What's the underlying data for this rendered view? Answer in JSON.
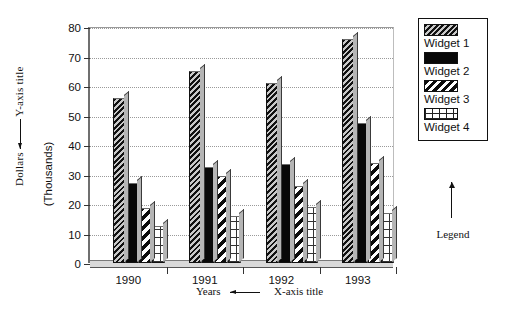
{
  "chart_data": {
    "type": "bar",
    "title": "",
    "categories": [
      "1990",
      "1991",
      "1992",
      "1993"
    ],
    "series": [
      {
        "name": "Widget 1",
        "values": [
          56,
          65,
          61,
          76
        ],
        "pattern": "diagonal-hatch-dark"
      },
      {
        "name": "Widget 2",
        "values": [
          27,
          32.5,
          33.5,
          47.5
        ],
        "pattern": "solid-black"
      },
      {
        "name": "Widget 3",
        "values": [
          18.5,
          29.5,
          26,
          34
        ],
        "pattern": "diagonal-stripe-white-on-black"
      },
      {
        "name": "Widget 4",
        "values": [
          12.5,
          16,
          19,
          17
        ],
        "pattern": "grid-crosshatch"
      }
    ],
    "xlabel": "Years",
    "ylabel": "Dollars",
    "yunits": "(Thousands)",
    "ylim": [
      0,
      80
    ],
    "ytick_step": 10,
    "yticks": [
      "80",
      "70",
      "60",
      "50",
      "40",
      "30",
      "20",
      "10",
      "0"
    ],
    "grid": true,
    "legend_position": "right"
  },
  "annotations": {
    "y_axis_label": "Dollars",
    "y_axis_callout": "Y-axis title",
    "y_axis_units": "(Thousands)",
    "x_axis_label": "Years",
    "x_axis_callout": "X-axis title",
    "legend_callout": "Legend"
  },
  "legend": {
    "entries": [
      {
        "label": "Widget 1"
      },
      {
        "label": "Widget 2"
      },
      {
        "label": "Widget 3"
      },
      {
        "label": "Widget 4"
      }
    ]
  },
  "colors": {
    "axis": "#111111",
    "gridline": "#9a9a9a",
    "bar_black": "#080808",
    "bar_hatch_dark": "#4a4a4a",
    "bar_highlight": "#b5b5b5",
    "background": "#ffffff"
  }
}
